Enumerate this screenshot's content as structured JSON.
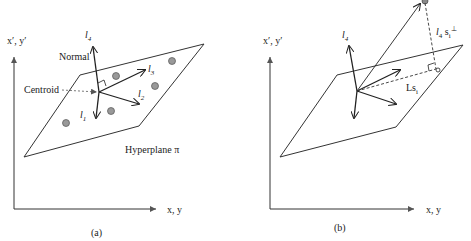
{
  "panels": [
    {
      "id": "a",
      "caption": "(a)",
      "axis_x_label": "x, y",
      "axis_y_label": "x′, y′",
      "normal_label": "Normal",
      "centroid_label": "Centroid",
      "hyperplane_label": "Hyperplane π",
      "vectors": [
        {
          "name": "l",
          "sub": "1"
        },
        {
          "name": "l",
          "sub": "2"
        },
        {
          "name": "l",
          "sub": "3"
        },
        {
          "name": "l",
          "sub": "4"
        }
      ],
      "points_count": 5
    },
    {
      "id": "b",
      "caption": "(b)",
      "axis_x_label": "x, y",
      "axis_y_label": "x′, y′",
      "normal_vector": {
        "name": "l",
        "sub": "4"
      },
      "projection_label": "Ls",
      "projection_sub": "i",
      "perp_label": "l",
      "perp_sub": "4",
      "perp_s": "s",
      "perp_s_sub": "i",
      "perp_sup": "⊥"
    }
  ]
}
